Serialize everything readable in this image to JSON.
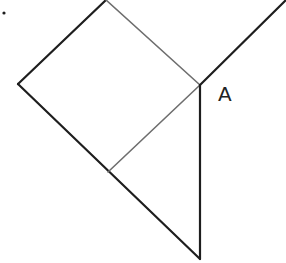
{
  "diagram": {
    "type": "geometry",
    "labels": {
      "vertex_A": "A"
    },
    "colors": {
      "dark_line": "#1e1e1e",
      "gray_line": "#6e6e6e",
      "background": "#ffffff"
    },
    "points": {
      "top": [
        106,
        0
      ],
      "A": [
        200,
        85
      ],
      "left": [
        18,
        84
      ],
      "mid_lower": [
        108,
        172
      ],
      "bottom": [
        200,
        259
      ],
      "top_right": [
        286,
        0
      ],
      "dot": [
        4,
        13
      ]
    }
  }
}
